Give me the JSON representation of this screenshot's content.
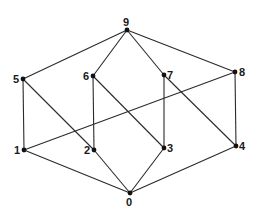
{
  "diagram": {
    "type": "graph",
    "nodes": [
      {
        "id": "0",
        "label": "0",
        "x": 130,
        "y": 193,
        "label_dx": -4,
        "label_dy": 13
      },
      {
        "id": "1",
        "label": "1",
        "x": 24,
        "y": 150,
        "label_dx": -10,
        "label_dy": 4
      },
      {
        "id": "2",
        "label": "2",
        "x": 94,
        "y": 150,
        "label_dx": -10,
        "label_dy": 4
      },
      {
        "id": "3",
        "label": "3",
        "x": 164,
        "y": 148,
        "label_dx": 3,
        "label_dy": 4
      },
      {
        "id": "4",
        "label": "4",
        "x": 236,
        "y": 146,
        "label_dx": 3,
        "label_dy": 4
      },
      {
        "id": "5",
        "label": "5",
        "x": 23,
        "y": 79,
        "label_dx": -10,
        "label_dy": 4
      },
      {
        "id": "6",
        "label": "6",
        "x": 93,
        "y": 76,
        "label_dx": -10,
        "label_dy": 4
      },
      {
        "id": "7",
        "label": "7",
        "x": 164,
        "y": 75,
        "label_dx": 3,
        "label_dy": 4
      },
      {
        "id": "8",
        "label": "8",
        "x": 235,
        "y": 72,
        "label_dx": 4,
        "label_dy": 4
      },
      {
        "id": "9",
        "label": "9",
        "x": 127,
        "y": 30,
        "label_dx": -4,
        "label_dy": -4
      }
    ],
    "edges": [
      [
        "9",
        "5"
      ],
      [
        "9",
        "6"
      ],
      [
        "9",
        "7"
      ],
      [
        "9",
        "8"
      ],
      [
        "5",
        "1"
      ],
      [
        "5",
        "2"
      ],
      [
        "6",
        "2"
      ],
      [
        "6",
        "3"
      ],
      [
        "7",
        "3"
      ],
      [
        "7",
        "4"
      ],
      [
        "8",
        "1"
      ],
      [
        "8",
        "4"
      ],
      [
        "1",
        "0"
      ],
      [
        "2",
        "0"
      ],
      [
        "3",
        "0"
      ],
      [
        "4",
        "0"
      ]
    ],
    "colors": {
      "edge": "#2a2a2a",
      "node": "#111111",
      "label": "#1a1a1a",
      "background": "#ffffff"
    }
  }
}
